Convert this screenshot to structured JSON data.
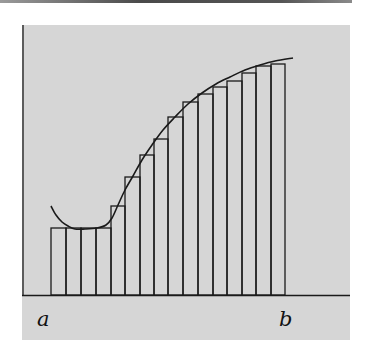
{
  "figure": {
    "labels": {
      "left_endpoint": "a",
      "right_endpoint": "b"
    },
    "colors": {
      "background_panel": "#d6d6d6",
      "line": "#1a1a1a",
      "page": "#ffffff"
    },
    "axis": {
      "baseline_y": 295,
      "x_start": 22,
      "x_end": 350
    },
    "curve_points": [
      [
        51,
        206
      ],
      [
        56,
        215
      ],
      [
        62,
        222
      ],
      [
        68,
        226
      ],
      [
        75,
        229
      ],
      [
        85,
        229
      ],
      [
        97,
        228
      ],
      [
        106,
        225
      ],
      [
        112,
        218
      ],
      [
        118,
        205
      ],
      [
        125,
        190
      ],
      [
        133,
        176
      ],
      [
        142,
        160
      ],
      [
        152,
        145
      ],
      [
        163,
        130
      ],
      [
        175,
        117
      ],
      [
        188,
        104
      ],
      [
        202,
        93
      ],
      [
        216,
        84
      ],
      [
        230,
        77
      ],
      [
        245,
        70
      ],
      [
        260,
        65
      ],
      [
        275,
        61
      ],
      [
        293,
        58
      ]
    ],
    "rectangles": [
      {
        "x0": 51,
        "x1": 66,
        "top": 228
      },
      {
        "x0": 66,
        "x1": 81,
        "top": 228
      },
      {
        "x0": 81,
        "x1": 96,
        "top": 228
      },
      {
        "x0": 96,
        "x1": 111,
        "top": 228
      },
      {
        "x0": 111,
        "x1": 125,
        "top": 206
      },
      {
        "x0": 125,
        "x1": 140,
        "top": 177
      },
      {
        "x0": 140,
        "x1": 154,
        "top": 155
      },
      {
        "x0": 154,
        "x1": 168,
        "top": 139
      },
      {
        "x0": 168,
        "x1": 183,
        "top": 117
      },
      {
        "x0": 183,
        "x1": 198,
        "top": 102
      },
      {
        "x0": 198,
        "x1": 213,
        "top": 94
      },
      {
        "x0": 213,
        "x1": 227,
        "top": 87
      },
      {
        "x0": 227,
        "x1": 242,
        "top": 81
      },
      {
        "x0": 242,
        "x1": 256,
        "top": 73
      },
      {
        "x0": 256,
        "x1": 271,
        "top": 66
      },
      {
        "x0": 271,
        "x1": 285,
        "top": 64
      }
    ]
  }
}
